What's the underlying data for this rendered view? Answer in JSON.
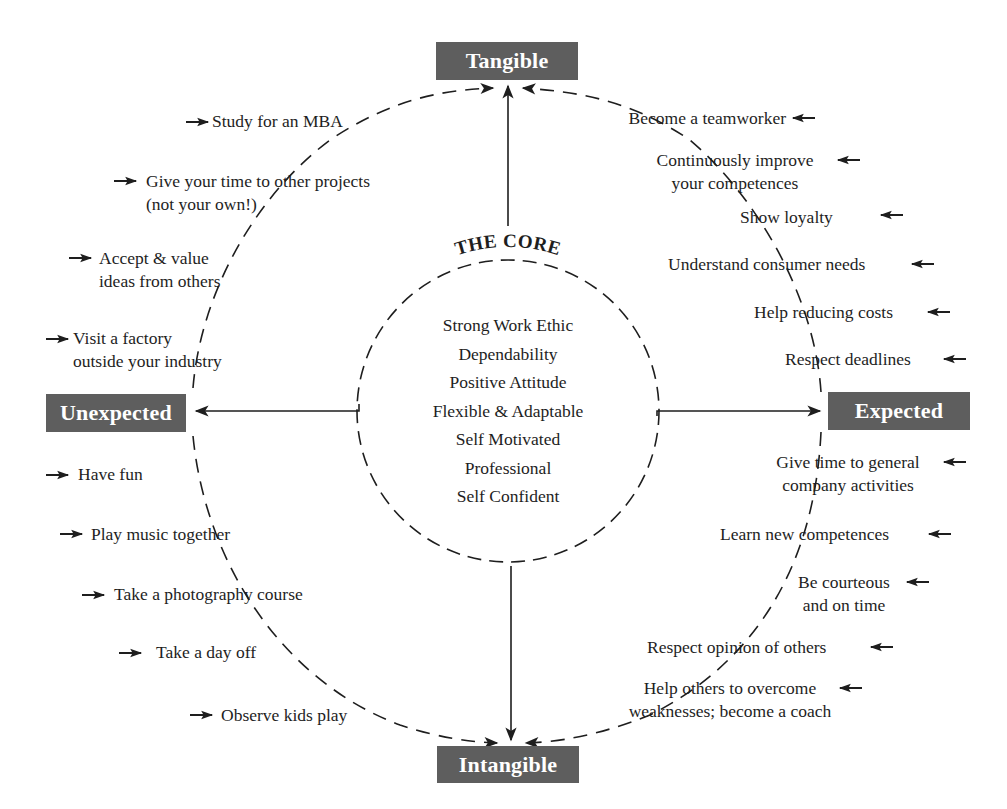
{
  "nodes": {
    "tangible": "Tangible",
    "unexpected": "Unexpected",
    "expected": "Expected",
    "intangible": "Intangible"
  },
  "core": {
    "title": "THE CORE",
    "items": [
      "Strong Work Ethic",
      "Dependability",
      "Positive Attitude",
      "Flexible & Adaptable",
      "Self Motivated",
      "Professional",
      "Self Confident"
    ]
  },
  "quadrants": {
    "unexpected_tangible": [
      {
        "line1": "Study for an MBA"
      },
      {
        "line1": "Give your time to other projects",
        "line2": "(not your own!)"
      },
      {
        "line1": "Accept & value",
        "line2": "ideas from others"
      },
      {
        "line1": "Visit a factory",
        "line2": "outside your industry"
      }
    ],
    "expected_tangible": [
      {
        "line1": "Become a teamworker"
      },
      {
        "line1": "Continuously improve",
        "line2": "your competences"
      },
      {
        "line1": "Show loyalty"
      },
      {
        "line1": "Understand consumer needs"
      },
      {
        "line1": "Help reducing costs"
      },
      {
        "line1": "Respect deadlines"
      }
    ],
    "unexpected_intangible": [
      {
        "line1": "Have fun"
      },
      {
        "line1": "Play music together"
      },
      {
        "line1": "Take a photography course"
      },
      {
        "line1": "Take a day off"
      },
      {
        "line1": "Observe kids play"
      }
    ],
    "expected_intangible": [
      {
        "line1": "Give time to general",
        "line2": "company activities"
      },
      {
        "line1": "Learn new competences"
      },
      {
        "line1": "Be courteous",
        "line2": "and on time"
      },
      {
        "line1": "Respect opinion of others"
      },
      {
        "line1": "Help others to overcome",
        "line2": "weaknesses; become a coach"
      }
    ]
  },
  "colors": {
    "node_fill": "#5e5e5e",
    "node_text": "#ffffff",
    "ink": "#1e1e1e",
    "background": "#ffffff"
  }
}
